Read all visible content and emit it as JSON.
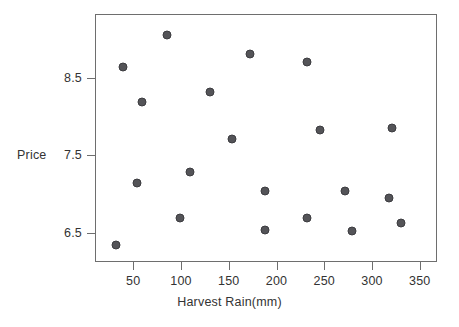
{
  "chart_data": {
    "type": "scatter",
    "title": "",
    "xlabel": "Harvest Rain(mm)",
    "ylabel": "Price",
    "xlim": [
      10,
      368
    ],
    "ylim": [
      6.12,
      9.32
    ],
    "xticks": [
      50,
      100,
      150,
      200,
      250,
      300,
      350
    ],
    "xtick_labels": [
      "50",
      "100",
      "150",
      "200",
      "250",
      "300",
      "350"
    ],
    "yticks": [
      6.5,
      7.5,
      8.5
    ],
    "ytick_labels": [
      "6.5",
      "7.5",
      "8.5"
    ],
    "grid": false,
    "legend": null,
    "marker_color": "#545458",
    "marker_edge_color": "#3c3c40",
    "frame_color": "#6e6e6e",
    "points": [
      {
        "x": 32,
        "y": 6.34
      },
      {
        "x": 39,
        "y": 8.64
      },
      {
        "x": 59,
        "y": 8.19
      },
      {
        "x": 54,
        "y": 7.14
      },
      {
        "x": 85,
        "y": 9.05
      },
      {
        "x": 99,
        "y": 6.69
      },
      {
        "x": 109,
        "y": 7.28
      },
      {
        "x": 130,
        "y": 8.32
      },
      {
        "x": 153,
        "y": 7.71
      },
      {
        "x": 172,
        "y": 8.8
      },
      {
        "x": 188,
        "y": 7.03
      },
      {
        "x": 188,
        "y": 6.53
      },
      {
        "x": 232,
        "y": 8.7
      },
      {
        "x": 232,
        "y": 6.69
      },
      {
        "x": 246,
        "y": 7.82
      },
      {
        "x": 272,
        "y": 7.03
      },
      {
        "x": 279,
        "y": 6.52
      },
      {
        "x": 321,
        "y": 7.85
      },
      {
        "x": 318,
        "y": 6.95
      },
      {
        "x": 330,
        "y": 6.62
      }
    ]
  }
}
